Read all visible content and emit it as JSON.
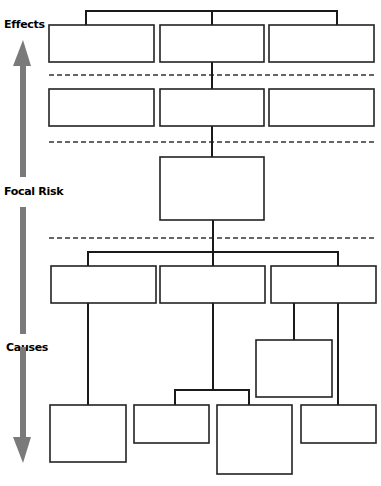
{
  "labels": {
    "effects": "Effects",
    "focal_risk": "Focal Risk",
    "causes": "Causes"
  },
  "colors": {
    "arrow": "#7a7a7a",
    "line": "#1a1a1a",
    "box_border": "#222222",
    "dashed": "#333333"
  },
  "diagram": {
    "type": "bow-tie risk tree",
    "levels": [
      {
        "name": "effects-level-1",
        "boxes": 3
      },
      {
        "name": "effects-level-2",
        "boxes": 3
      },
      {
        "name": "focal-risk",
        "boxes": 1
      },
      {
        "name": "causes-level-1",
        "boxes": 3
      },
      {
        "name": "causes-level-2",
        "boxes": 1
      },
      {
        "name": "causes-level-3",
        "boxes": 4
      }
    ]
  }
}
